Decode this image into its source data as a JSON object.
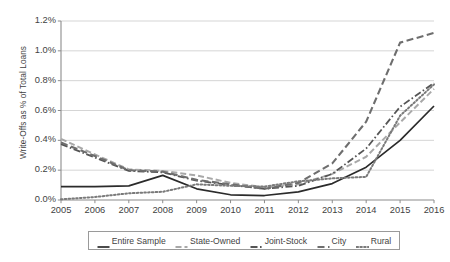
{
  "chart_data": {
    "type": "line",
    "title": "",
    "xlabel": "",
    "ylabel": "Write-Offs as % of Total Loans",
    "x": [
      2005,
      2006,
      2007,
      2008,
      2009,
      2010,
      2011,
      2012,
      2013,
      2014,
      2015,
      2016
    ],
    "xticklabels": [
      "2005",
      "2006",
      "2007",
      "2008",
      "2009",
      "2010",
      "2011",
      "2012",
      "2013",
      "2014",
      "2015",
      "2016"
    ],
    "yticklabels": [
      "0.0%",
      "0.2%",
      "0.4%",
      "0.6%",
      "0.8%",
      "1.0%",
      "1.2%"
    ],
    "ytickvalues": [
      0.0,
      0.2,
      0.4,
      0.6,
      0.8,
      1.0,
      1.2
    ],
    "ylim": [
      0.0,
      1.2
    ],
    "xlim": [
      2005,
      2016
    ],
    "grid": "horizontal",
    "legend_position": "bottom",
    "units": "percent",
    "series": [
      {
        "name": "Entire Sample",
        "style": "solid",
        "color": "#2b2b2b",
        "width": 1.7,
        "values": [
          0.09,
          0.09,
          0.095,
          0.165,
          0.075,
          0.035,
          0.03,
          0.055,
          0.11,
          0.22,
          0.4,
          0.63
        ]
      },
      {
        "name": "State-Owned",
        "style": "dashed",
        "color": "#a8a8a8",
        "width": 2.0,
        "values": [
          0.41,
          0.305,
          0.205,
          0.195,
          0.165,
          0.115,
          0.085,
          0.105,
          0.175,
          0.29,
          0.52,
          0.745
        ]
      },
      {
        "name": "Joint-Stock",
        "style": "dashdot",
        "color": "#555555",
        "width": 1.8,
        "values": [
          0.375,
          0.285,
          0.195,
          0.185,
          0.13,
          0.1,
          0.075,
          0.095,
          0.175,
          0.345,
          0.625,
          0.785
        ]
      },
      {
        "name": "City",
        "style": "longdash",
        "color": "#6e6e6e",
        "width": 2.1,
        "values": [
          0.385,
          0.295,
          0.2,
          0.19,
          0.135,
          0.105,
          0.075,
          0.115,
          0.245,
          0.525,
          1.055,
          1.12
        ]
      },
      {
        "name": "Rural",
        "style": "dotted",
        "color": "#7a7a7a",
        "width": 2.0,
        "values": [
          0.005,
          0.02,
          0.045,
          0.055,
          0.105,
          0.095,
          0.09,
          0.125,
          0.145,
          0.155,
          0.565,
          0.775
        ]
      }
    ]
  },
  "legend": {
    "items": [
      {
        "label": "Entire Sample"
      },
      {
        "label": "State-Owned"
      },
      {
        "label": "Joint-Stock"
      },
      {
        "label": "City"
      },
      {
        "label": "Rural"
      }
    ]
  }
}
